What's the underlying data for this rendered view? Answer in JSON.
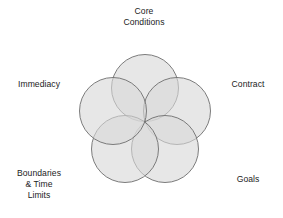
{
  "diagram": {
    "type": "five-circle-overlapping-venn",
    "title": "Core Conditions",
    "labels": [
      {
        "id": "core-conditions",
        "text": "Core\nConditions",
        "position": "top"
      },
      {
        "id": "contract",
        "text": "Contract",
        "position": "right"
      },
      {
        "id": "goals",
        "text": "Goals",
        "position": "bottom-right"
      },
      {
        "id": "boundaries-time-limits",
        "text": "Boundaries\n& Time\nLimits",
        "position": "bottom-left"
      },
      {
        "id": "immediacy",
        "text": "Immediacy",
        "position": "left"
      }
    ],
    "colors": {
      "circle_fill": "#d8d8d8",
      "circle_stroke": "#6e6e6e",
      "background": "#ffffff",
      "text": "#1c1c1c"
    },
    "circles": [
      {
        "id": "circle-core-conditions",
        "cx": 145,
        "cy": 88,
        "r": 33.5
      },
      {
        "id": "circle-contract",
        "cx": 177,
        "cy": 111,
        "r": 33.5
      },
      {
        "id": "circle-goals",
        "cx": 165,
        "cy": 149,
        "r": 33.5
      },
      {
        "id": "circle-boundaries",
        "cx": 125,
        "cy": 149,
        "r": 33.5
      },
      {
        "id": "circle-immediacy",
        "cx": 113,
        "cy": 111,
        "r": 33.5
      }
    ]
  }
}
